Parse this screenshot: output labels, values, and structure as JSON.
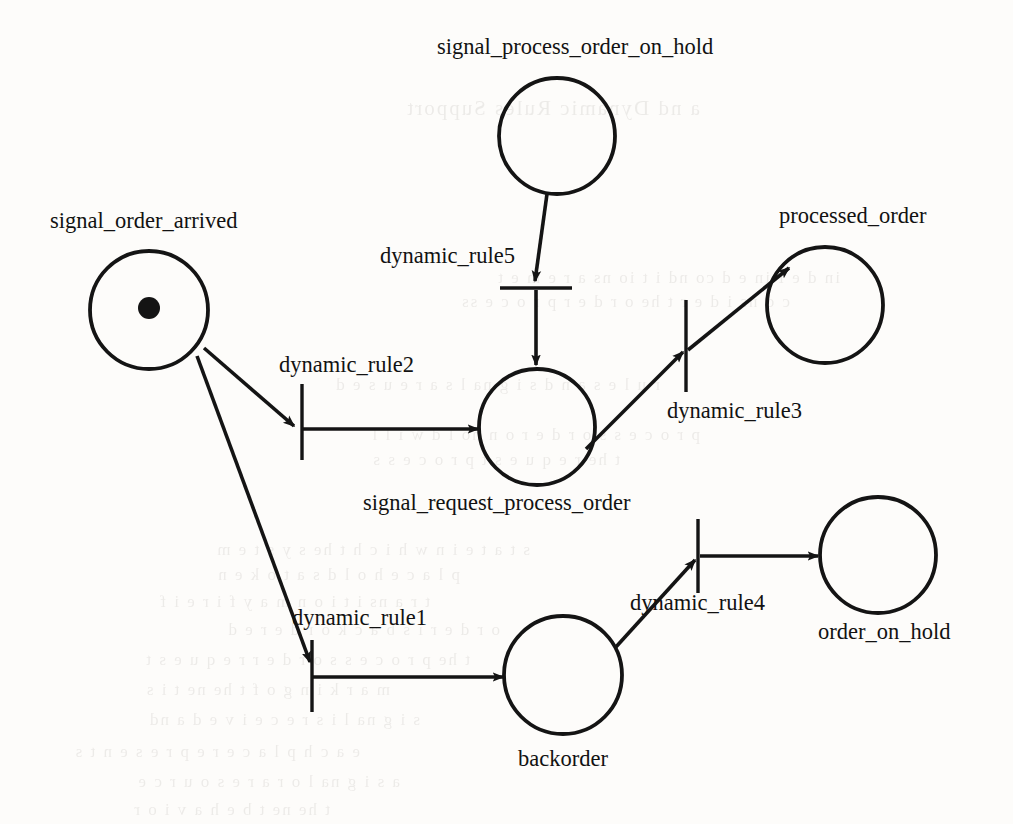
{
  "diagram": {
    "type": "petri-net",
    "canvas": {
      "width": 1013,
      "height": 824
    },
    "stroke_color": "#141414",
    "background_color": "#fdfcfa"
  },
  "places": [
    {
      "id": "signal_order_arrived",
      "label": "signal_order_arrived",
      "cx": 149,
      "cy": 310,
      "r": 59,
      "tokens": 1,
      "token_r": 11,
      "label_x": 50,
      "label_y": 210
    },
    {
      "id": "signal_process_order_on_hold",
      "label": "signal_process_order_on_hold",
      "cx": 557,
      "cy": 136,
      "r": 58,
      "tokens": 0,
      "token_r": 0,
      "label_x": 437,
      "label_y": 36
    },
    {
      "id": "signal_request_process_order",
      "label": "signal_request_process_order",
      "cx": 537,
      "cy": 427,
      "r": 58,
      "tokens": 0,
      "token_r": 0,
      "label_x": 363,
      "label_y": 492
    },
    {
      "id": "processed_order",
      "label": "processed_order",
      "cx": 825,
      "cy": 305,
      "r": 58,
      "tokens": 0,
      "token_r": 0,
      "label_x": 779,
      "label_y": 205
    },
    {
      "id": "backorder",
      "label": "backorder",
      "cx": 563,
      "cy": 675,
      "r": 59,
      "tokens": 0,
      "token_r": 0,
      "label_x": 518,
      "label_y": 748
    },
    {
      "id": "order_on_hold",
      "label": "order_on_hold",
      "cx": 878,
      "cy": 555,
      "r": 58,
      "tokens": 0,
      "token_r": 0,
      "label_x": 818,
      "label_y": 621
    }
  ],
  "transitions": [
    {
      "id": "dynamic_rule5",
      "label": "dynamic_rule5",
      "orientation": "horizontal",
      "x1": 500,
      "y1": 288,
      "x2": 572,
      "y2": 288,
      "label_x": 380,
      "label_y": 245
    },
    {
      "id": "dynamic_rule2",
      "label": "dynamic_rule2",
      "orientation": "vertical",
      "x1": 302,
      "y1": 384,
      "x2": 302,
      "y2": 460,
      "label_x": 279,
      "label_y": 354
    },
    {
      "id": "dynamic_rule3",
      "label": "dynamic_rule3",
      "orientation": "vertical",
      "x1": 686,
      "y1": 300,
      "x2": 686,
      "y2": 392,
      "label_x": 667,
      "label_y": 400
    },
    {
      "id": "dynamic_rule1",
      "label": "dynamic_rule1",
      "orientation": "vertical",
      "x1": 312,
      "y1": 640,
      "x2": 312,
      "y2": 712,
      "label_x": 292,
      "label_y": 607
    },
    {
      "id": "dynamic_rule4",
      "label": "dynamic_rule4",
      "orientation": "vertical",
      "x1": 698,
      "y1": 519,
      "x2": 698,
      "y2": 593,
      "label_x": 630,
      "label_y": 592
    }
  ],
  "arcs": [
    {
      "id": "arc-order-arrived-to-rule2",
      "from": "signal_order_arrived",
      "to": "dynamic_rule2",
      "points": "204,348 294,426",
      "arrow": true
    },
    {
      "id": "arc-rule2-to-request-process",
      "from": "dynamic_rule2",
      "to": "signal_request_process_order",
      "points": "303,429 478,429",
      "arrow": true
    },
    {
      "id": "arc-order-arrived-to-rule1",
      "from": "signal_order_arrived",
      "to": "dynamic_rule1",
      "points": "197,356 310,662",
      "arrow": true
    },
    {
      "id": "arc-rule1-to-backorder",
      "from": "dynamic_rule1",
      "to": "backorder",
      "points": "313,677 503,677",
      "arrow": true
    },
    {
      "id": "arc-on-hold-signal-to-rule5",
      "from": "signal_process_order_on_hold",
      "to": "dynamic_rule5",
      "points": "547,194 535,281",
      "arrow": true
    },
    {
      "id": "arc-rule5-to-request-process",
      "from": "dynamic_rule5",
      "to": "signal_request_process_order",
      "points": "536,290 536,365",
      "arrow": true
    },
    {
      "id": "arc-request-process-to-rule3",
      "from": "signal_request_process_order",
      "to": "dynamic_rule3",
      "points": "586,449 683,352",
      "arrow": true
    },
    {
      "id": "arc-rule3-to-processed-order",
      "from": "dynamic_rule3",
      "to": "processed_order",
      "points": "688,350 789,268",
      "arrow": true
    },
    {
      "id": "arc-backorder-to-rule4",
      "from": "backorder",
      "to": "dynamic_rule4",
      "points": "615,648 695,560",
      "arrow": true
    },
    {
      "id": "arc-rule4-to-order-on-hold",
      "from": "dynamic_rule4",
      "to": "order_on_hold",
      "points": "700,556 818,556",
      "arrow": true
    }
  ],
  "bleed_through_text": [
    {
      "text": "a nd Dynamic Rules Support",
      "x": 700,
      "y": 96,
      "size": 21
    },
    {
      "text": "in  d e f in e d  co nd i t io ns  a r e  m e t",
      "x": 840,
      "y": 268,
      "size": 17
    },
    {
      "text": "c o ns i d e r  t he  o r d e r  p r o c e ss",
      "x": 790,
      "y": 292,
      "size": 17
    },
    {
      "text": "r u l e s  a n d  s i g na l s  a r e  u s e d",
      "x": 660,
      "y": 375,
      "size": 17
    },
    {
      "text": "p r o c e s s  o r d e r  o n  ho l d  w i l l",
      "x": 700,
      "y": 425,
      "size": 17
    },
    {
      "text": "t he  r e q u e s t  p r o c e s s",
      "x": 620,
      "y": 450,
      "size": 17
    },
    {
      "text": "s t a t e  i n  w h i c h  t he  s y s t e m",
      "x": 530,
      "y": 540,
      "size": 17
    },
    {
      "text": "p l a c e  h o l d s  a  t o k e n",
      "x": 460,
      "y": 565,
      "size": 17
    },
    {
      "text": "t r a ns i t i o n  m a y  f i r e  i f",
      "x": 430,
      "y": 592,
      "size": 17
    },
    {
      "text": "o r d e r  i s  b a c k o r d e r e d",
      "x": 500,
      "y": 620,
      "size": 17
    },
    {
      "text": "t he  p r o c e s s  o r d e r  r e q u e s t",
      "x": 470,
      "y": 650,
      "size": 17
    },
    {
      "text": "m a r k i n g  o f  t he  ne t  i s",
      "x": 390,
      "y": 680,
      "size": 17
    },
    {
      "text": "s i g na l  i s  r e c e i v e d  a nd",
      "x": 420,
      "y": 710,
      "size": 17
    },
    {
      "text": "e a c h  p l a c e  r e p r e s e n t s",
      "x": 360,
      "y": 742,
      "size": 17
    },
    {
      "text": "a  s i g na l  o r  a  r e s o u r c e",
      "x": 400,
      "y": 772,
      "size": 17
    },
    {
      "text": "t he  ne t  b e h a v i o r",
      "x": 330,
      "y": 800,
      "size": 17
    }
  ]
}
